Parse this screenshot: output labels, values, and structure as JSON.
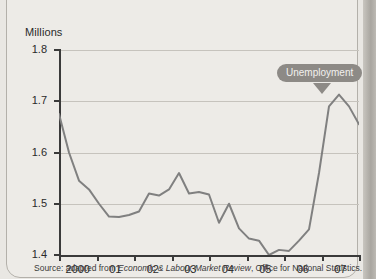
{
  "chart_data": {
    "type": "line",
    "title": "",
    "ylabel": "Millions",
    "xlabel": "",
    "ylim": [
      1.4,
      1.8
    ],
    "yticks": [
      "1.4",
      "1.5",
      "1.6",
      "1.7",
      "1.8"
    ],
    "ytick_values": [
      1.4,
      1.5,
      1.6,
      1.7,
      1.8
    ],
    "xticks": [
      "2000",
      "01",
      "02",
      "03",
      "04",
      "05",
      "06",
      "07"
    ],
    "grid": true,
    "legend": "none",
    "line_color": "#808080",
    "annotations": [
      {
        "text": "Unemployment",
        "x": "06",
        "y": 1.713,
        "style": "callout-pill"
      }
    ],
    "series": [
      {
        "name": "Unemployment",
        "units": "Millions",
        "x": [
          "1999 Q4",
          "2000 Q1",
          "2000 Q2",
          "2000 Q3",
          "2000 Q4",
          "2001 Q1",
          "2001 Q2",
          "2001 Q3",
          "2001 Q4",
          "2002 Q1",
          "2002 Q2",
          "2002 Q3",
          "2002 Q4",
          "2003 Q1",
          "2003 Q2",
          "2003 Q3",
          "2003 Q4",
          "2004 Q1",
          "2004 Q2",
          "2004 Q3",
          "2004 Q4",
          "2005 Q1",
          "2005 Q2",
          "2005 Q3",
          "2005 Q4",
          "2006 Q1",
          "2006 Q2",
          "2006 Q3",
          "2006 Q4",
          "2007 Q1",
          "2007 Q2"
        ],
        "values": [
          1.675,
          1.6,
          1.545,
          1.528,
          1.5,
          1.475,
          1.474,
          1.478,
          1.485,
          1.52,
          1.516,
          1.528,
          1.56,
          1.52,
          1.523,
          1.518,
          1.463,
          1.5,
          1.452,
          1.432,
          1.428,
          1.4,
          1.41,
          1.408,
          1.428,
          1.45,
          1.56,
          1.69,
          1.713,
          1.69,
          1.655
        ]
      }
    ]
  },
  "source": {
    "prefix": "Source: adapted from ",
    "publication": "Economic & Labour Market Review",
    "suffix": ", Office for National Statistics."
  }
}
